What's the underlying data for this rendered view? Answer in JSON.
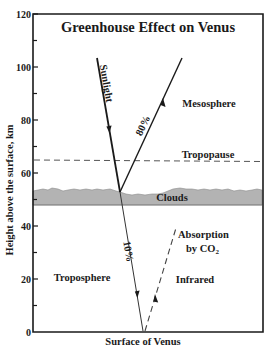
{
  "title": "Greenhouse Effect on Venus",
  "y_axis": {
    "label": "Height above the surface, km",
    "ticks": [
      "0",
      "20",
      "40",
      "60",
      "80",
      "100",
      "120"
    ],
    "range": [
      0,
      120
    ],
    "unit": "km"
  },
  "x_axis": {
    "label": "Surface of Venus"
  },
  "regions": {
    "mesosphere": "Mesosphere",
    "tropopause": "Tropopause",
    "clouds": "Clouds",
    "troposphere": "Troposphere"
  },
  "rays": {
    "sunlight": "Sunlight",
    "reflected_pct": "80%",
    "transmitted_pct": "10%",
    "infrared": "Infrared",
    "absorption_line1": "Absorption",
    "absorption_line2": "by CO",
    "absorption_sub": "2"
  },
  "levels_km": {
    "tropopause": 64,
    "cloud_top": 53,
    "cloud_bottom": 48
  },
  "colors": {
    "line": "#1a1a1a",
    "clouds_fill": "#b3b3b3",
    "dashed": "#555555"
  }
}
